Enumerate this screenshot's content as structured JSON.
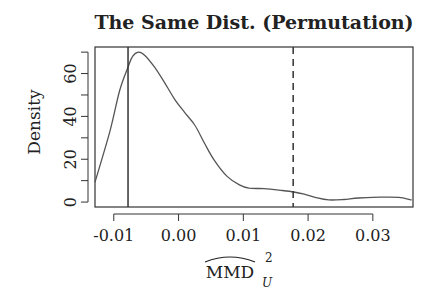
{
  "chart_data": {
    "type": "line",
    "title": "The Same Dist. (Permutation)",
    "xlabel": "MMD_U^2 (hat)",
    "xlabel_parts": {
      "main": "MMD",
      "superscript": "2",
      "subscript": "U",
      "has_hat": true
    },
    "ylabel": "Density",
    "xlim": [
      -0.0129,
      0.0362
    ],
    "ylim": [
      -2.3,
      72.4
    ],
    "xticks": [
      -0.01,
      0.0,
      0.01,
      0.02,
      0.03
    ],
    "xtick_labels": [
      "-0.01",
      "0.00",
      "0.01",
      "0.02",
      "0.03"
    ],
    "yticks": [
      0,
      10,
      20,
      30,
      40,
      50,
      60,
      70
    ],
    "ytick_labels": [
      "0",
      "",
      "20",
      "",
      "40",
      "",
      "60",
      ""
    ],
    "grid": false,
    "legend": null,
    "series": [
      {
        "name": "density",
        "x": [
          -0.0129,
          -0.0106,
          -0.0091,
          -0.0078,
          -0.0071,
          -0.0062,
          -0.0052,
          -0.0037,
          -0.0022,
          -0.0006,
          0.0009,
          0.0025,
          0.004,
          0.0055,
          0.0075,
          0.0094,
          0.0109,
          0.0132,
          0.0155,
          0.0178,
          0.0194,
          0.0214,
          0.0232,
          0.0255,
          0.0278,
          0.0317,
          0.034,
          0.036
        ],
        "y": [
          9.3,
          33,
          52,
          63,
          68,
          70,
          68.5,
          63,
          56,
          48,
          42,
          36,
          27.5,
          19.6,
          12,
          8,
          6.5,
          6.3,
          5.6,
          4.7,
          3.7,
          2.0,
          1.0,
          1.2,
          1.9,
          2.3,
          2.2,
          1.0
        ]
      }
    ],
    "vlines": [
      {
        "name": "solid-reference",
        "x": -0.0078,
        "style": "solid"
      },
      {
        "name": "dashed-reference",
        "x": 0.0177,
        "style": "dashed"
      }
    ],
    "colors": {
      "line": "#555555",
      "axis": "#333333",
      "vline": "#333333"
    }
  }
}
